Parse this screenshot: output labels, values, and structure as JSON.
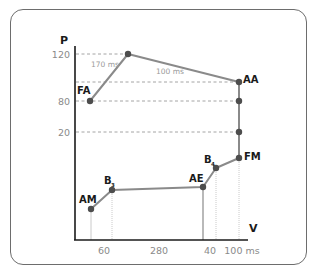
{
  "diagram": {
    "y_axis_label": "P",
    "x_axis_label": "V",
    "y_ticks": [
      "120",
      "80",
      "20"
    ],
    "x_ticks": [
      "60",
      "280",
      "40",
      "100 ms"
    ],
    "segment_labels": {
      "fa_to_peak": "170 ms",
      "peak_to_aa": "100 ms"
    },
    "points": {
      "FA": "FA",
      "AA": "AA",
      "FM": "FM",
      "AE": "AE",
      "AM": "AM",
      "B3": {
        "base": "B",
        "sub": "3"
      },
      "B4": {
        "base": "B",
        "sub": "4"
      }
    },
    "colors": {
      "axis": "#1a1a1a",
      "curve": "#8a8a8a",
      "dots": "#4d4d4d",
      "guides": "#9a9a9a",
      "border": "#6d6d6d"
    }
  }
}
